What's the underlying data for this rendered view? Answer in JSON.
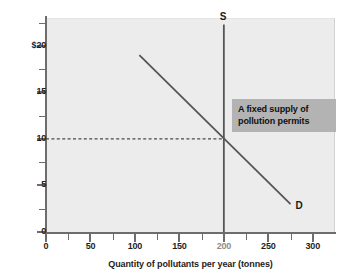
{
  "chart_data": {
    "type": "line",
    "title": "",
    "xlabel": "Quantity of pollutants per year (tonnes)",
    "ylabel": "Price (in thousands)",
    "xlim": [
      0,
      325
    ],
    "ylim": [
      0,
      23
    ],
    "grid": false,
    "legend": "none",
    "x_ticks": [
      {
        "value": 0,
        "label": "0",
        "major": true,
        "muted": false
      },
      {
        "value": 25,
        "label": "",
        "major": false,
        "muted": false
      },
      {
        "value": 50,
        "label": "50",
        "major": true,
        "muted": false
      },
      {
        "value": 75,
        "label": "",
        "major": false,
        "muted": false
      },
      {
        "value": 100,
        "label": "100",
        "major": true,
        "muted": false
      },
      {
        "value": 125,
        "label": "",
        "major": false,
        "muted": false
      },
      {
        "value": 150,
        "label": "150",
        "major": true,
        "muted": false
      },
      {
        "value": 175,
        "label": "",
        "major": false,
        "muted": false
      },
      {
        "value": 200,
        "label": "200",
        "major": true,
        "muted": true
      },
      {
        "value": 225,
        "label": "",
        "major": false,
        "muted": false
      },
      {
        "value": 250,
        "label": "250",
        "major": true,
        "muted": false
      },
      {
        "value": 275,
        "label": "",
        "major": false,
        "muted": false
      },
      {
        "value": 300,
        "label": "300",
        "major": true,
        "muted": false
      }
    ],
    "y_ticks": [
      {
        "value": 0,
        "label": "0",
        "major": true
      },
      {
        "value": 2.5,
        "label": "",
        "major": false
      },
      {
        "value": 5,
        "label": "5",
        "major": true
      },
      {
        "value": 7.5,
        "label": "",
        "major": false
      },
      {
        "value": 10,
        "label": "10",
        "major": true
      },
      {
        "value": 12.5,
        "label": "",
        "major": false
      },
      {
        "value": 15,
        "label": "15",
        "major": true
      },
      {
        "value": 17.5,
        "label": "",
        "major": false
      },
      {
        "value": 20,
        "label": "$20",
        "major": true
      },
      {
        "value": 22.5,
        "label": "",
        "major": false
      }
    ],
    "series": [
      {
        "name": "S",
        "label": "S",
        "kind": "supply-vertical",
        "color": "#555555",
        "points": [
          {
            "x": 200,
            "y": 22.3
          },
          {
            "x": 200,
            "y": 0
          }
        ]
      },
      {
        "name": "D",
        "label": "D",
        "kind": "demand-downward",
        "color": "#555555",
        "points": [
          {
            "x": 105,
            "y": 19.0
          },
          {
            "x": 275,
            "y": 3.0
          }
        ]
      }
    ],
    "equilibrium": {
      "x": 200,
      "y": 10,
      "guide_color": "#4a4a4a",
      "guide_style": "dashed"
    },
    "annotations": [
      {
        "name": "fixed-supply-callout",
        "line1": "A fixed supply of",
        "line2": "pollution permits",
        "background": "#b3b3b3",
        "text_color": "#101010"
      }
    ],
    "colors": {
      "plot_background": "#ececec",
      "page_background": "#ffffff",
      "axis": "#6d6d6d",
      "curve": "#555555",
      "text": "#1d1d1d"
    }
  }
}
